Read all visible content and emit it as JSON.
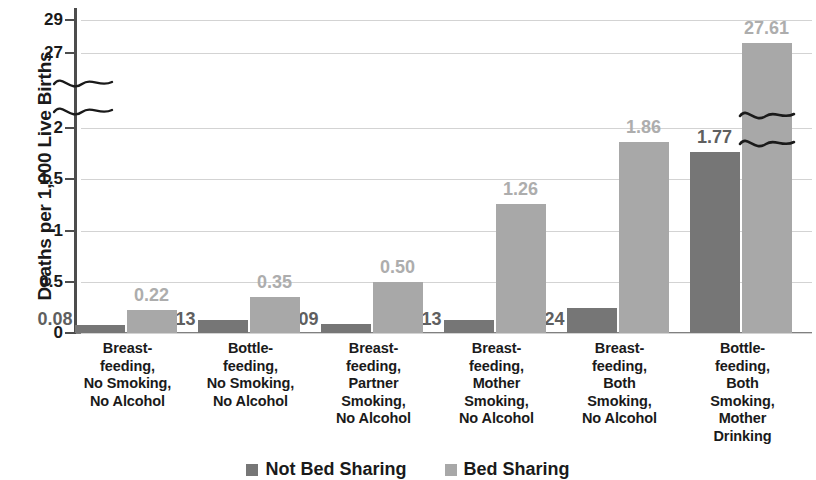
{
  "chart_data": {
    "type": "bar",
    "title": "",
    "xlabel": "",
    "ylabel": "Deaths per 1,000 Live Births",
    "grid": true,
    "legend_position": "bottom",
    "axis_break": true,
    "y_ticks_lower": [
      "0",
      "0.5",
      "1",
      "1.5",
      "2"
    ],
    "y_ticks_upper": [
      "27",
      "29"
    ],
    "ylim_lower": [
      0,
      2
    ],
    "ylim_upper": [
      26,
      29.5
    ],
    "categories": [
      "Breast-\nfeeding,\nNo Smoking,\nNo Alcohol",
      "Bottle-\nfeeding,\nNo Smoking,\nNo Alcohol",
      "Breast-\nfeeding,\nPartner\nSmoking,\nNo Alcohol",
      "Breast-\nfeeding,\nMother\nSmoking,\nNo Alcohol",
      "Breast-\nfeeding,\nBoth\nSmoking,\nNo Alcohol",
      "Bottle-\nfeeding,\nBoth\nSmoking,\nMother\nDrinking"
    ],
    "series": [
      {
        "name": "Not Bed Sharing",
        "color": "#767676",
        "values": [
          0.08,
          0.13,
          0.09,
          0.13,
          0.24,
          1.77
        ],
        "labels": [
          "0.08",
          "0.13",
          "0.09",
          "0.13",
          "0.24",
          "1.77"
        ]
      },
      {
        "name": "Bed Sharing",
        "color": "#a8a8a8",
        "values": [
          0.22,
          0.35,
          0.5,
          1.26,
          1.86,
          27.61
        ],
        "labels": [
          "0.22",
          "0.35",
          "0.50",
          "1.26",
          "1.86",
          "27.61"
        ]
      }
    ]
  },
  "legend": {
    "items": [
      {
        "label": "Not Bed Sharing",
        "color": "#767676"
      },
      {
        "label": "Bed Sharing",
        "color": "#a8a8a8"
      }
    ]
  },
  "colors": {
    "not_bed_sharing": "#767676",
    "bed_sharing": "#a8a8a8",
    "gridline": "#d3d3d3",
    "axis": "#4d4d4d",
    "text": "#1a1a1a"
  }
}
